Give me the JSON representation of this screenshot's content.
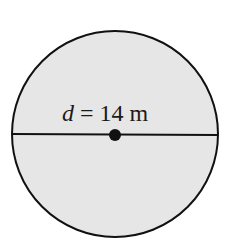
{
  "diagram": {
    "shape": "circle",
    "fill_color": "#e6e6e6",
    "stroke_color": "#111111",
    "label": {
      "variable": "d",
      "equals": " = ",
      "value": "14",
      "unit": " m"
    },
    "center_point": true
  }
}
